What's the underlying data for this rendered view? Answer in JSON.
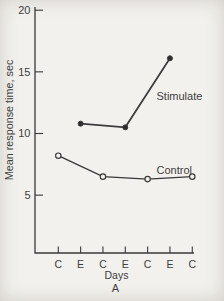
{
  "figure": {
    "panel_label": "A",
    "background": "#f3f1ed",
    "line_color": "#3a3a3a",
    "text_color": "#3e3e3e",
    "marker_fill_open": "#f6f4f0",
    "marker_fill_solid": "#2e2e2e"
  },
  "chart_data": {
    "type": "line",
    "title": "",
    "xlabel": "Days",
    "ylabel": "Mean response time, sec",
    "panel_label": "A",
    "x_tick_labels": [
      "C",
      "E",
      "C",
      "E",
      "C",
      "E",
      "C"
    ],
    "y_ticks": [
      20,
      15,
      10,
      5
    ],
    "ylim": [
      0,
      20
    ],
    "grid": false,
    "legend_position": "inline-annotations",
    "series": [
      {
        "name": "Stimulate",
        "marker": "filled-circle",
        "x_indices": [
          1,
          3,
          5
        ],
        "x_labels_at_points": [
          "E",
          "E",
          "E"
        ],
        "values": [
          10.8,
          10.5,
          16.1
        ]
      },
      {
        "name": "Control",
        "marker": "open-circle",
        "x_indices": [
          0,
          2,
          4,
          6
        ],
        "x_labels_at_points": [
          "C",
          "C",
          "C",
          "C"
        ],
        "values": [
          8.2,
          6.5,
          6.3,
          6.5
        ]
      }
    ]
  }
}
